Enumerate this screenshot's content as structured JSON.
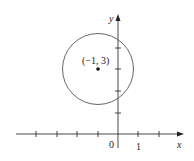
{
  "diagram": {
    "type": "coordinate-plane-circle",
    "axes": {
      "x_label": "x",
      "y_label": "y",
      "origin_label": "0",
      "x_tick_label": "1",
      "x_ticks": [
        -4,
        -3,
        -2,
        -1,
        1,
        2
      ],
      "y_ticks": [
        1,
        2,
        3,
        4
      ]
    },
    "circle": {
      "center": [
        -1,
        3
      ],
      "center_label": "(−1, 3)",
      "radius": 1.73
    },
    "colors": {
      "axis": "#333333",
      "circle": "#555555",
      "point": "#111111"
    }
  }
}
